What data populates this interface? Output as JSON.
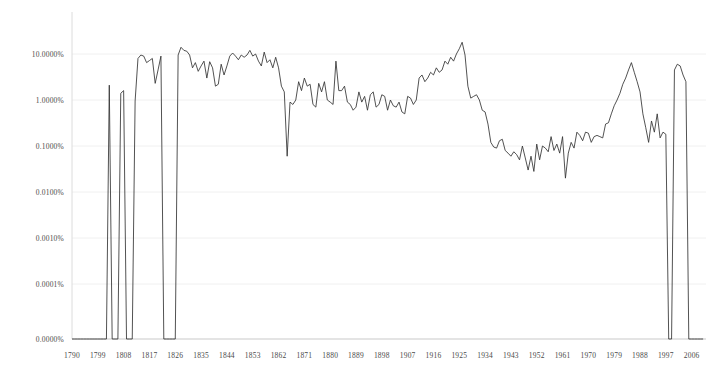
{
  "chart_data": {
    "type": "line",
    "title": "",
    "subtitle": "",
    "xlabel": "",
    "ylabel": "",
    "yscale": "log",
    "grid": true,
    "grid_axis": "y",
    "legend": "none",
    "line_color": "#333333",
    "axis_color": "#d9d9d9",
    "grid_color": "#f0f0f0",
    "background": "#ffffff",
    "xlim": [
      1790,
      2011
    ],
    "ylim_percent": [
      0.0,
      20.0
    ],
    "ytick_labels": [
      "10.0000%",
      "1.0000%",
      "0.1000%",
      "0.0100%",
      "0.0010%",
      "0.0001%",
      "0.0000%"
    ],
    "ytick_values": [
      10.0,
      1.0,
      0.1,
      0.01,
      0.001,
      0.0001,
      0.0
    ],
    "xtick_labels": [
      "1790",
      "1799",
      "1808",
      "1817",
      "1826",
      "1835",
      "1844",
      "1853",
      "1862",
      "1871",
      "1880",
      "1889",
      "1898",
      "1907",
      "1916",
      "1925",
      "1934",
      "1943",
      "1952",
      "1961",
      "1970",
      "1979",
      "1988",
      "1997",
      "2006"
    ],
    "xtick_values": [
      1790,
      1799,
      1808,
      1817,
      1826,
      1835,
      1844,
      1853,
      1862,
      1871,
      1880,
      1889,
      1898,
      1907,
      1916,
      1925,
      1934,
      1943,
      1952,
      1961,
      1970,
      1979,
      1988,
      1997,
      2006
    ],
    "x": [
      1790,
      1791,
      1792,
      1793,
      1794,
      1795,
      1796,
      1797,
      1798,
      1799,
      1800,
      1801,
      1802,
      1803,
      1804,
      1805,
      1806,
      1807,
      1808,
      1809,
      1810,
      1811,
      1812,
      1813,
      1814,
      1815,
      1816,
      1817,
      1818,
      1819,
      1820,
      1821,
      1822,
      1823,
      1824,
      1825,
      1826,
      1827,
      1828,
      1829,
      1830,
      1831,
      1832,
      1833,
      1834,
      1835,
      1836,
      1837,
      1838,
      1839,
      1840,
      1841,
      1842,
      1843,
      1844,
      1845,
      1846,
      1847,
      1848,
      1849,
      1850,
      1851,
      1852,
      1853,
      1854,
      1855,
      1856,
      1857,
      1858,
      1859,
      1860,
      1861,
      1862,
      1863,
      1864,
      1865,
      1866,
      1867,
      1868,
      1869,
      1870,
      1871,
      1872,
      1873,
      1874,
      1875,
      1876,
      1877,
      1878,
      1879,
      1880,
      1881,
      1882,
      1883,
      1884,
      1885,
      1886,
      1887,
      1888,
      1889,
      1890,
      1891,
      1892,
      1893,
      1894,
      1895,
      1896,
      1897,
      1898,
      1899,
      1900,
      1901,
      1902,
      1903,
      1904,
      1905,
      1906,
      1907,
      1908,
      1909,
      1910,
      1911,
      1912,
      1913,
      1914,
      1915,
      1916,
      1917,
      1918,
      1919,
      1920,
      1921,
      1922,
      1923,
      1924,
      1925,
      1926,
      1927,
      1928,
      1929,
      1930,
      1931,
      1932,
      1933,
      1934,
      1935,
      1936,
      1937,
      1938,
      1939,
      1940,
      1941,
      1942,
      1943,
      1944,
      1945,
      1946,
      1947,
      1948,
      1949,
      1950,
      1951,
      1952,
      1953,
      1954,
      1955,
      1956,
      1957,
      1958,
      1959,
      1960,
      1961,
      1962,
      1963,
      1964,
      1965,
      1966,
      1967,
      1968,
      1969,
      1970,
      1971,
      1972,
      1973,
      1974,
      1975,
      1976,
      1977,
      1978,
      1979,
      1980,
      1981,
      1982,
      1983,
      1984,
      1985,
      1986,
      1987,
      1988,
      1989,
      1990,
      1991,
      1992,
      1993,
      1994,
      1995,
      1996,
      1997,
      1998,
      1999,
      2000,
      2001,
      2002,
      2003,
      2004,
      2005,
      2006,
      2007,
      2008,
      2009,
      2010
    ],
    "values_percent": [
      0,
      0,
      0,
      0,
      0,
      0,
      0,
      0,
      0,
      0,
      0,
      0,
      0,
      2.1,
      0,
      0,
      0,
      1.4,
      1.6,
      0,
      0,
      0,
      0.95,
      8.0,
      9.5,
      9.0,
      6.5,
      7.2,
      8.0,
      2.3,
      4.5,
      9.0,
      0,
      0,
      0,
      0,
      0,
      9.5,
      14.0,
      12.0,
      11.5,
      9.5,
      5.0,
      6.5,
      4.2,
      5.5,
      7.0,
      3.0,
      6.8,
      5.0,
      2.0,
      2.2,
      6.0,
      3.5,
      5.5,
      9.0,
      10.5,
      9.0,
      7.5,
      9.5,
      8.5,
      9.5,
      12.0,
      9.0,
      10.0,
      7.0,
      5.5,
      11.0,
      6.5,
      7.5,
      5.0,
      8.5,
      5.0,
      2.0,
      1.5,
      0.06,
      0.9,
      0.8,
      1.0,
      2.5,
      1.6,
      3.0,
      2.0,
      2.2,
      0.8,
      0.7,
      2.3,
      1.5,
      2.5,
      1.0,
      0.9,
      0.8,
      7.0,
      1.6,
      1.6,
      2.0,
      0.9,
      0.8,
      0.6,
      0.7,
      1.5,
      0.9,
      1.2,
      0.6,
      1.3,
      1.5,
      0.7,
      0.8,
      1.3,
      1.2,
      0.6,
      1.0,
      0.75,
      0.7,
      0.9,
      0.55,
      0.5,
      1.2,
      1.1,
      0.8,
      1.0,
      3.0,
      3.5,
      2.5,
      3.0,
      4.0,
      3.5,
      5.0,
      4.0,
      4.5,
      7.0,
      6.0,
      8.5,
      7.0,
      10.0,
      13.0,
      18.0,
      9.5,
      2.0,
      1.1,
      1.2,
      1.3,
      1.0,
      0.6,
      0.55,
      0.3,
      0.12,
      0.095,
      0.09,
      0.13,
      0.14,
      0.08,
      0.07,
      0.06,
      0.075,
      0.065,
      0.05,
      0.1,
      0.055,
      0.03,
      0.06,
      0.028,
      0.11,
      0.05,
      0.1,
      0.09,
      0.075,
      0.16,
      0.08,
      0.11,
      0.07,
      0.16,
      0.02,
      0.07,
      0.12,
      0.09,
      0.2,
      0.17,
      0.13,
      0.2,
      0.19,
      0.12,
      0.16,
      0.17,
      0.16,
      0.15,
      0.3,
      0.32,
      0.5,
      0.75,
      1.0,
      1.4,
      2.2,
      3.0,
      4.5,
      6.5,
      4.0,
      2.5,
      1.5,
      0.5,
      0.25,
      0.12,
      0.35,
      0.2,
      0.5,
      0.15,
      0.2,
      0.18,
      0,
      0,
      4.5,
      6.0,
      5.5,
      3.5,
      2.5
    ]
  }
}
